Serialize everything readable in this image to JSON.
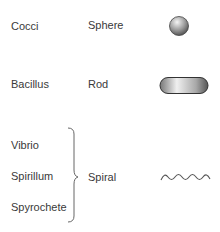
{
  "rows": [
    {
      "name": "Cocci",
      "shape": "Sphere",
      "icon": "sphere-icon"
    },
    {
      "name": "Bacillus",
      "shape": "Rod",
      "icon": "rod-icon"
    }
  ],
  "spiral_group": {
    "names": [
      "Vibrio",
      "Spirillum",
      "Spyrochete"
    ],
    "shape": "Spiral",
    "icon": "spiral-wave-icon"
  },
  "colors": {
    "text": "#3a3a3a",
    "shape_dark": "#555555",
    "shape_light": "#eeeeee"
  }
}
